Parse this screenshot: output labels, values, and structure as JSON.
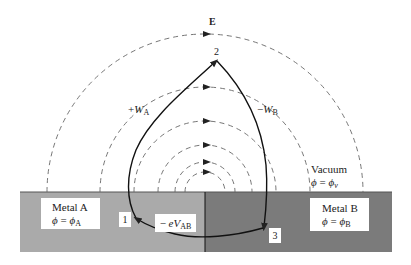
{
  "diagram": {
    "field_label": "E",
    "points": [
      {
        "id": "1",
        "label": "1"
      },
      {
        "id": "2",
        "label": "2"
      },
      {
        "id": "3",
        "label": "3"
      }
    ],
    "path_labels": {
      "wa_sign": "+",
      "wa_sym": "W",
      "wa_sub": "A",
      "wb_sign": "−",
      "wb_sym": "W",
      "wb_sub": "B",
      "evab_sign": "− ",
      "evab_sym": "eV",
      "evab_sub": "AB"
    },
    "vacuum": {
      "title": "Vacuum",
      "phi": "ϕ",
      "eq": " = ",
      "phi2": "ϕ",
      "sub": "v"
    },
    "metal_a": {
      "title": "Metal A",
      "phi": "ϕ",
      "eq": " = ",
      "phi2": "ϕ",
      "sub": "A",
      "color": "#aaaaaa"
    },
    "metal_b": {
      "title": "Metal B",
      "phi": "ϕ",
      "eq": " = ",
      "phi2": "ϕ",
      "sub": "B",
      "color": "#7b7b7b"
    }
  }
}
